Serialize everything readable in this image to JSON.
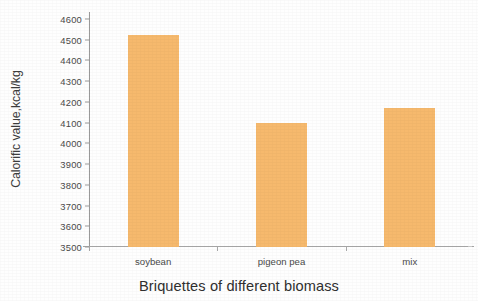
{
  "chart_data": {
    "type": "bar",
    "title": "",
    "categories": [
      "soybean",
      "pigeon pea",
      "mix"
    ],
    "values": [
      4525,
      4100,
      4170
    ],
    "series": [
      {
        "name": "Calorific value",
        "values": [
          4525,
          4100,
          4170
        ]
      }
    ],
    "xlabel": "Briquettes of different biomass",
    "ylabel": "Calorific value,kcal/kg",
    "ylim": [
      3500,
      4600
    ],
    "ytick_step": 100,
    "ytick_labels": [
      "4600",
      "4500",
      "4400",
      "4300",
      "4200",
      "4100",
      "4000",
      "3900",
      "3800",
      "3700",
      "3600",
      "3500"
    ],
    "ytick_values": [
      4600,
      4500,
      4400,
      4300,
      4200,
      4100,
      4000,
      3900,
      3800,
      3700,
      3600,
      3500
    ],
    "grid": false,
    "legend": false,
    "bar_color": "#f6b96d",
    "axis_color": "#9a9a9a"
  }
}
